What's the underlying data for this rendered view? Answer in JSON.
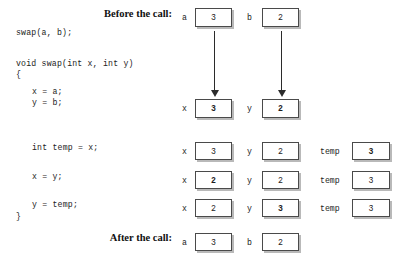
{
  "figure": {
    "title_before": "Before the call:",
    "title_after": "After the call:"
  },
  "code": {
    "call_line": "swap(a, b);",
    "signature": "void swap(int x, int y)",
    "open_brace": "{",
    "line_xa": "x = a;",
    "line_yb": "y = b;",
    "line_temp": "int temp = x;",
    "line_xy": "x = y;",
    "line_ytemp": "y = temp;",
    "close_brace": "}"
  },
  "labels": {
    "a": "a",
    "b": "b",
    "x": "x",
    "y": "y",
    "temp": "temp"
  },
  "rows": [
    {
      "id": "before-call",
      "cells": [
        {
          "label": "a",
          "value": "3",
          "bold": false
        },
        {
          "label": "b",
          "value": "2",
          "bold": false
        }
      ]
    },
    {
      "id": "params-initialized",
      "cells": [
        {
          "label": "x",
          "value": "3",
          "bold": true
        },
        {
          "label": "y",
          "value": "2",
          "bold": true
        }
      ]
    },
    {
      "id": "after-int-temp-equals-x",
      "cells": [
        {
          "label": "x",
          "value": "3",
          "bold": false
        },
        {
          "label": "y",
          "value": "2",
          "bold": false
        },
        {
          "label": "temp",
          "value": "3",
          "bold": true
        }
      ]
    },
    {
      "id": "after-x-equals-y",
      "cells": [
        {
          "label": "x",
          "value": "2",
          "bold": true
        },
        {
          "label": "y",
          "value": "2",
          "bold": false
        },
        {
          "label": "temp",
          "value": "3",
          "bold": false
        }
      ]
    },
    {
      "id": "after-y-equals-temp",
      "cells": [
        {
          "label": "x",
          "value": "2",
          "bold": false
        },
        {
          "label": "y",
          "value": "3",
          "bold": true
        },
        {
          "label": "temp",
          "value": "3",
          "bold": false
        }
      ]
    },
    {
      "id": "after-call",
      "cells": [
        {
          "label": "a",
          "value": "3",
          "bold": false
        },
        {
          "label": "b",
          "value": "2",
          "bold": false
        }
      ]
    }
  ],
  "arrows": [
    {
      "id": "a-to-x",
      "from": "a",
      "to": "x"
    },
    {
      "id": "b-to-y",
      "from": "b",
      "to": "y"
    }
  ],
  "colors": {
    "box_border": "#4a4a4a",
    "box_shadow": "#b9b9b9",
    "text": "#1d1d1d",
    "arrow": "#2b2b2b",
    "background": "#ffffff"
  }
}
